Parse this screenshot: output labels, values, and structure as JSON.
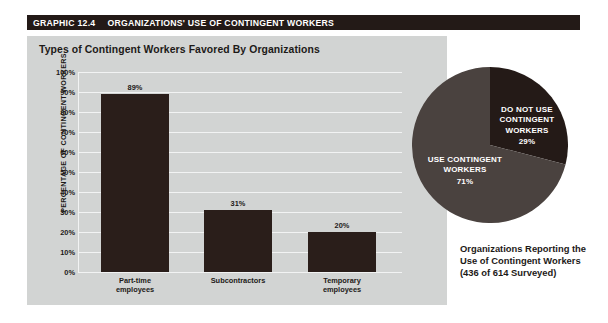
{
  "header": {
    "graphic_number": "GRAPHIC 12.4",
    "title": "ORGANIZATIONS' USE OF CONTINGENT WORKERS",
    "bar_color": "#231a17"
  },
  "panel": {
    "title": "Types of Contingent Workers Favored By Organizations",
    "background_color": "#d2d4d3"
  },
  "caption": "Organizations Reporting the Use of Contingent Workers (436 of 614 Surveyed)",
  "chart_data": [
    {
      "type": "bar",
      "title": "Types of Contingent Workers Favored By Organizations",
      "xlabel": "",
      "ylabel": "PERCENTAGE OF CONTINGENT WORKERS",
      "ylim": [
        0,
        100
      ],
      "yticks": [
        "0%",
        "10%",
        "20%",
        "30%",
        "40%",
        "50%",
        "60%",
        "70%",
        "80%",
        "90%",
        "100%"
      ],
      "grid": true,
      "legend": "none",
      "bar_color": "#2a1e1a",
      "categories": [
        "Part-time employees",
        "Subcontractors",
        "Temporary employees"
      ],
      "values": [
        89,
        31,
        20
      ],
      "data_labels": [
        "89%",
        "31%",
        "20%"
      ]
    },
    {
      "type": "pie",
      "title": "Organizations Reporting the Use of Contingent Workers (436 of 614 Surveyed)",
      "legend": "inside-slices",
      "slices": [
        {
          "label": "DO NOT USE CONTINGENT WORKERS",
          "value": 29,
          "data_label": "29%",
          "color": "#241a17"
        },
        {
          "label": "USE CONTINGENT WORKERS",
          "value": 71,
          "data_label": "71%",
          "color": "#4a423f"
        }
      ]
    }
  ]
}
